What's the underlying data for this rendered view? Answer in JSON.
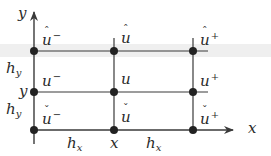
{
  "diagram": {
    "type": "finite-difference stencil grid",
    "colors": {
      "line": "#3a3a3a",
      "node": "#222222",
      "band": "#eeeeee",
      "text": "#2a2a2a"
    },
    "axes": {
      "x_label": "x",
      "y_label": "y"
    },
    "nodes": {
      "top_left": {
        "base": "u",
        "accent": "ˆ",
        "sup": "−"
      },
      "top_mid": {
        "base": "u",
        "accent": "ˆ",
        "sup": ""
      },
      "top_right": {
        "base": "u",
        "accent": "ˆ",
        "sup": "+"
      },
      "mid_left": {
        "base": "u",
        "accent": "",
        "sup": "−"
      },
      "mid_mid": {
        "base": "u",
        "accent": "",
        "sup": ""
      },
      "mid_right": {
        "base": "u",
        "accent": "",
        "sup": "+"
      },
      "bot_left": {
        "base": "u",
        "accent": "ˇ",
        "sup": "−"
      },
      "bot_mid": {
        "base": "u",
        "accent": "ˇ",
        "sup": ""
      },
      "bot_right": {
        "base": "u",
        "accent": "ˇ",
        "sup": "+"
      }
    },
    "spacing_labels": {
      "hy_upper": {
        "base": "h",
        "sub": "y"
      },
      "hy_lower": {
        "base": "h",
        "sub": "y"
      },
      "hx_left": {
        "base": "h",
        "sub": "x"
      },
      "hx_right": {
        "base": "h",
        "sub": "x"
      }
    },
    "coordinate_labels": {
      "y_tick": "y",
      "x_tick": "x"
    }
  }
}
